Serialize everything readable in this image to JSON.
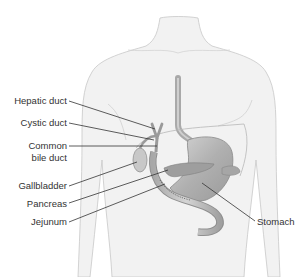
{
  "diagram": {
    "type": "anatomical-illustration",
    "colors": {
      "body_fill": "#f2f2f2",
      "body_outline": "#c8c8c8",
      "organ_fill": "#b5b5b5",
      "organ_dark": "#8c8c8c",
      "leader_line": "#333333",
      "text": "#333333"
    },
    "labels": [
      {
        "id": "hepatic-duct",
        "text": "Hepatic duct"
      },
      {
        "id": "cystic-duct",
        "text": "Cystic duct"
      },
      {
        "id": "common-bile-duct-1",
        "text": "Common"
      },
      {
        "id": "common-bile-duct-2",
        "text": "bile duct"
      },
      {
        "id": "gallbladder",
        "text": "Gallbladder"
      },
      {
        "id": "pancreas",
        "text": "Pancreas"
      },
      {
        "id": "jejunum",
        "text": "Jejunum"
      },
      {
        "id": "stomach",
        "text": "Stomach"
      }
    ]
  }
}
